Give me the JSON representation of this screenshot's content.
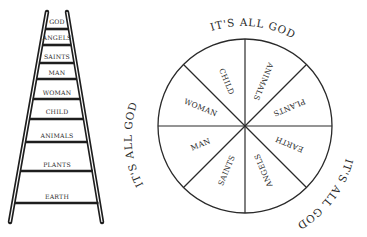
{
  "ladder": {
    "rungs": [
      {
        "label": "GOD",
        "y": 23
      },
      {
        "label": "ANGELS",
        "y": 38
      },
      {
        "label": "SAINTS",
        "y": 57
      },
      {
        "label": "MAN",
        "y": 73
      },
      {
        "label": "WOMAN",
        "y": 93
      },
      {
        "label": "CHILD",
        "y": 112
      },
      {
        "label": "ANIMALS",
        "y": 137
      },
      {
        "label": "PLANTS",
        "y": 166
      },
      {
        "label": "EARTH",
        "y": 198
      }
    ]
  },
  "circle": {
    "segments": [
      {
        "label": "ANIMALS"
      },
      {
        "label": "PLANTS"
      },
      {
        "label": "EARTH"
      },
      {
        "label": "ANGELS"
      },
      {
        "label": "SAINTS"
      },
      {
        "label": "MAN"
      },
      {
        "label": "WOMAN"
      },
      {
        "label": "CHILD"
      }
    ],
    "arc_texts": [
      {
        "label": "IT'S ALL GOD"
      },
      {
        "label": "IT'S ALL GOD"
      },
      {
        "label": "IT'S ALL GOD"
      }
    ]
  },
  "colors": {
    "ink": "#2a2a2a",
    "background": "#ffffff"
  }
}
